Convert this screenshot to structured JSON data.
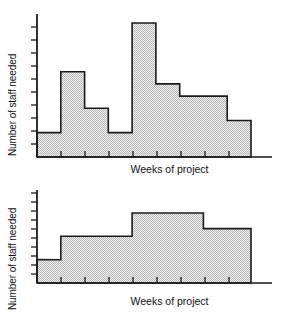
{
  "figure": {
    "title": "",
    "background": "#ffffff",
    "line_color": "#1a1a1a",
    "fill_color": "#d9d9d9",
    "fill_pattern": "dither-checkerboard"
  },
  "panels": [
    {
      "id": "top",
      "ylabel": "Number of staff needed",
      "xlabel": "Weeks of project"
    },
    {
      "id": "bottom",
      "ylabel": "Number of staff needed",
      "xlabel": "Weeks of project"
    }
  ],
  "chart_data": [
    {
      "type": "bar",
      "id": "unlevelled-resource-histogram",
      "title": "",
      "xlabel": "Weeks of project",
      "ylabel": "Number of staff needed",
      "grid": false,
      "legend": null,
      "axis_tick_labels": {
        "x": [],
        "y": []
      },
      "x_tick_count": 9,
      "y_tick_count": 11,
      "xlim": [
        0,
        9
      ],
      "ylim": [
        0,
        11
      ],
      "categories": [
        "1",
        "2",
        "3",
        "4",
        "5",
        "6",
        "7",
        "8",
        "9"
      ],
      "values": [
        2,
        7,
        4,
        2,
        11,
        6,
        5,
        5,
        3
      ],
      "step_description": "Irregular staffing profile with a sharp peak at week 5"
    },
    {
      "type": "bar",
      "id": "levelled-resource-histogram",
      "title": "",
      "xlabel": "Weeks of project",
      "ylabel": "Number of staff needed",
      "grid": false,
      "legend": null,
      "axis_tick_labels": {
        "x": [],
        "y": []
      },
      "x_tick_count": 9,
      "y_tick_count": 11,
      "xlim": [
        0,
        9
      ],
      "ylim": [
        0,
        11
      ],
      "categories": [
        "1",
        "2",
        "3",
        "4",
        "5",
        "6",
        "7",
        "8",
        "9"
      ],
      "values": [
        3,
        6,
        6,
        6,
        9,
        9,
        9,
        7,
        7
      ],
      "step_description": "Smoothed, resource-levelled staffing profile"
    }
  ]
}
